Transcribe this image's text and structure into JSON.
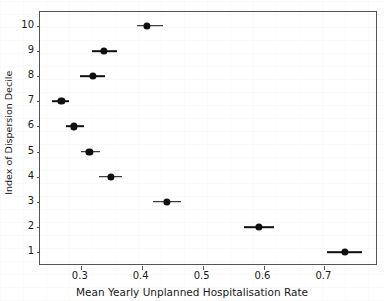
{
  "chart_data": {
    "type": "scatter",
    "title": "",
    "xlabel": "Mean Yearly Unplanned Hospitalisation Rate",
    "ylabel": "Index of Dispersion Decile",
    "xlim": [
      0.233,
      0.788
    ],
    "ylim": [
      0.45,
      10.55
    ],
    "grid": false,
    "legend": null,
    "xticks": [
      "0.3",
      "0.4",
      "0.5",
      "0.6",
      "0.7"
    ],
    "xtick_values": [
      0.3,
      0.4,
      0.5,
      0.6,
      0.7
    ],
    "yticks": [
      "10",
      "9",
      "8",
      "7",
      "6",
      "5",
      "4",
      "3",
      "2",
      "1"
    ],
    "ytick_values": [
      10,
      9,
      8,
      7,
      6,
      5,
      4,
      3,
      2,
      1
    ],
    "y_axis_inverted": true,
    "marker": "circle",
    "marker_color": "#101010",
    "errorbar_color": "#101010",
    "points": [
      {
        "decile": 10,
        "value": 0.409,
        "ci_low": 0.392,
        "ci_high": 0.435
      },
      {
        "decile": 9,
        "value": 0.338,
        "ci_low": 0.319,
        "ci_high": 0.359
      },
      {
        "decile": 8,
        "value": 0.32,
        "ci_low": 0.299,
        "ci_high": 0.34
      },
      {
        "decile": 7,
        "value": 0.268,
        "ci_low": 0.252,
        "ci_high": 0.281
      },
      {
        "decile": 6,
        "value": 0.289,
        "ci_low": 0.275,
        "ci_high": 0.306
      },
      {
        "decile": 5,
        "value": 0.314,
        "ci_low": 0.3,
        "ci_high": 0.332
      },
      {
        "decile": 4,
        "value": 0.349,
        "ci_low": 0.33,
        "ci_high": 0.368
      },
      {
        "decile": 3,
        "value": 0.442,
        "ci_low": 0.418,
        "ci_high": 0.464
      },
      {
        "decile": 2,
        "value": 0.592,
        "ci_low": 0.568,
        "ci_high": 0.618
      },
      {
        "decile": 1,
        "value": 0.734,
        "ci_low": 0.705,
        "ci_high": 0.762
      }
    ]
  }
}
